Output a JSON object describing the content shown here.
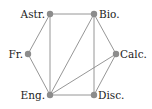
{
  "diagram": {
    "type": "graph",
    "colors": {
      "edge": "#8a8a8a",
      "node": "#8c8c8c",
      "label": "#222222",
      "background": "#ffffff"
    },
    "nodes": [
      {
        "id": "astr",
        "label": "Astr.",
        "x": 50,
        "y": 14,
        "label_x": 45,
        "label_y": 18,
        "anchor": "end"
      },
      {
        "id": "bio",
        "label": "Bio.",
        "x": 94,
        "y": 14,
        "label_x": 99,
        "label_y": 18,
        "anchor": "start"
      },
      {
        "id": "fr",
        "label": "Fr.",
        "x": 28,
        "y": 54,
        "label_x": 23,
        "label_y": 58,
        "anchor": "end"
      },
      {
        "id": "calc",
        "label": "Calc.",
        "x": 116,
        "y": 54,
        "label_x": 120,
        "label_y": 58,
        "anchor": "start"
      },
      {
        "id": "eng",
        "label": "Eng.",
        "x": 50,
        "y": 95,
        "label_x": 45,
        "label_y": 99,
        "anchor": "end"
      },
      {
        "id": "disc",
        "label": "Disc.",
        "x": 94,
        "y": 95,
        "label_x": 98,
        "label_y": 99,
        "anchor": "start"
      }
    ],
    "edges": [
      [
        "astr",
        "bio"
      ],
      [
        "astr",
        "fr"
      ],
      [
        "astr",
        "eng"
      ],
      [
        "bio",
        "calc"
      ],
      [
        "bio",
        "eng"
      ],
      [
        "bio",
        "disc"
      ],
      [
        "fr",
        "eng"
      ],
      [
        "calc",
        "eng"
      ],
      [
        "calc",
        "disc"
      ],
      [
        "eng",
        "disc"
      ]
    ]
  }
}
